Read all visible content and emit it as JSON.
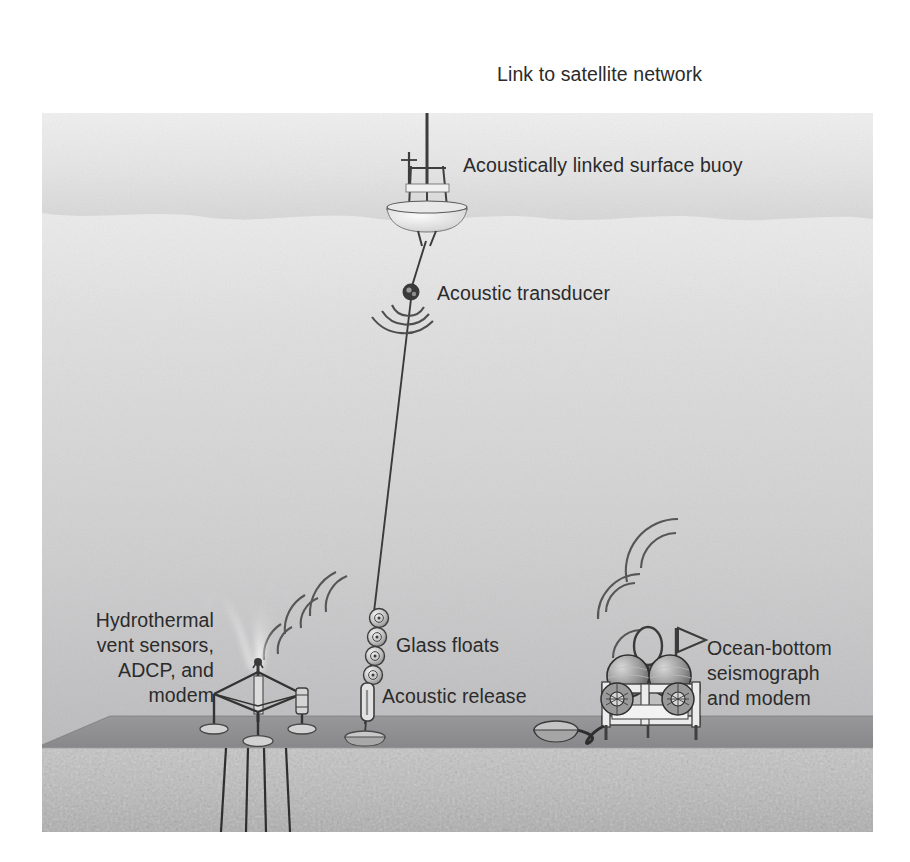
{
  "figure": {
    "type": "diagram",
    "canvas": {
      "width": 910,
      "height": 862
    },
    "scene_bounds": {
      "left": 42,
      "top": 113,
      "right": 873,
      "bottom": 832
    },
    "colors": {
      "page_background": "#ffffff",
      "sky_top": "#ededed",
      "sky_bottom": "#dcdcdc",
      "water_top": "#e9e9e9",
      "water_bottom": "#b3b3b3",
      "seafloor_top_band": "#8f8f8f",
      "sediment": "#bdbdbd",
      "ink": "#2b2b2b",
      "label_text": "#2b2b2b",
      "vent_plume": "#f2f2f2",
      "frame_white": "#e3e3e3"
    },
    "water_surface_y": 218,
    "seafloor_y": 716,
    "sediment_top_y": 748
  },
  "labels": {
    "satellite_link": "Link to satellite network",
    "surface_buoy": "Acoustically linked surface buoy",
    "acoustic_transducer": "Acoustic transducer",
    "hydrothermal": "Hydrothermal\nvent sensors,\nADCP, and\nmodem",
    "glass_floats": "Glass floats",
    "acoustic_release": "Acoustic release",
    "seismograph": "Ocean-bottom\nseismograph\nand modem"
  },
  "components": [
    {
      "id": "satellite-link",
      "name": "Link to satellite network",
      "icon": "lightning-bolt-icon",
      "label_position": {
        "x": 497,
        "y": 62
      },
      "symbol_position": {
        "x": 463,
        "y": 77
      }
    },
    {
      "id": "surface-buoy",
      "name": "Acoustically linked surface buoy",
      "label_position": {
        "x": 463,
        "y": 153
      },
      "anchor_position": {
        "x": 427,
        "y": 185
      },
      "parts": [
        "antenna-mast",
        "lattice-tower",
        "float-hull"
      ]
    },
    {
      "id": "acoustic-transducer",
      "name": "Acoustic transducer",
      "label_position": {
        "x": 437,
        "y": 281
      },
      "anchor_position": {
        "x": 411,
        "y": 293
      },
      "acoustic_arcs": 3
    },
    {
      "id": "hydrothermal-package",
      "name": "Hydrothermal vent sensors, ADCP, and modem",
      "label_position": {
        "x": 64,
        "y": 608
      },
      "anchor_position": {
        "x": 258,
        "y": 700
      },
      "parts": [
        "tripod-frame",
        "vent-plume",
        "sediment-probes",
        "disc-feet"
      ],
      "acoustic_arcs": 6
    },
    {
      "id": "glass-floats",
      "name": "Glass floats",
      "label_position": {
        "x": 396,
        "y": 633
      },
      "count": 4,
      "anchor_position": {
        "x": 373,
        "y": 630
      }
    },
    {
      "id": "acoustic-release",
      "name": "Acoustic release",
      "label_position": {
        "x": 382,
        "y": 684
      },
      "anchor_position": {
        "x": 368,
        "y": 688
      }
    },
    {
      "id": "ocean-bottom-seismograph",
      "name": "Ocean-bottom seismograph and modem",
      "label_position": {
        "x": 707,
        "y": 636
      },
      "anchor_position": {
        "x": 660,
        "y": 690
      },
      "parts": [
        "frame",
        "spherical-floats",
        "reels",
        "flag",
        "cable",
        "anchor"
      ],
      "acoustic_arcs": 5
    }
  ]
}
